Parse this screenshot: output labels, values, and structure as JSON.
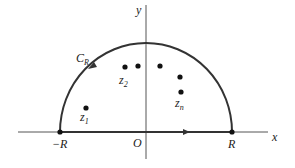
{
  "diagram": {
    "axes": {
      "x_label": "x",
      "y_label": "y",
      "origin_label": "O"
    },
    "contour": {
      "label_main": "C",
      "label_sub": "R",
      "left_end_label": "−R",
      "right_end_label": "R"
    },
    "points": [
      {
        "name": "z1",
        "label_main": "z",
        "label_sub": "1"
      },
      {
        "name": "z2",
        "label_main": "z",
        "label_sub": "2"
      },
      {
        "name": "p3",
        "label_main": "",
        "label_sub": ""
      },
      {
        "name": "p4",
        "label_main": "",
        "label_sub": ""
      },
      {
        "name": "p5",
        "label_main": "",
        "label_sub": ""
      },
      {
        "name": "zn",
        "label_main": "z",
        "label_sub": "n"
      }
    ],
    "colors": {
      "line": "#333333",
      "axis": "#555555",
      "point": "#111111"
    }
  }
}
